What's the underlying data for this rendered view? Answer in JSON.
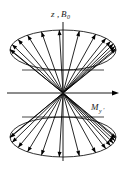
{
  "figure": {
    "caption": "",
    "background_color": "#ffffff",
    "ink_color": "#000000",
    "width": 128,
    "height": 171
  },
  "axes": {
    "vertical": {
      "name": "z-axis",
      "label_main": "z",
      "label_separator": ",",
      "label_second": "B",
      "label_second_subscript": "0",
      "label_full": "z, B0",
      "x": 63,
      "y_top": 22,
      "y_bottom": 161,
      "has_arrowhead": false
    },
    "horizontal": {
      "name": "transverse-axis",
      "label_main": "M",
      "label_subscript": "y",
      "label_prime": "'",
      "label_full": "My'",
      "y": 93,
      "x_left": 7,
      "x_right": 119,
      "has_arrowhead": true
    }
  },
  "origin": {
    "x": 63,
    "y": 93
  },
  "chart_data": {
    "type": "scatter",
    "xlabel": "My'",
    "ylabel": "z, B0",
    "cones": [
      {
        "name": "upper-cone",
        "apex": {
          "x": 63,
          "y": 93
        },
        "rim_center": {
          "x": 63,
          "y": 50
        },
        "rim_rx": 53,
        "rim_ry": 20,
        "back_rim_y": 70,
        "vector_count": 13
      },
      {
        "name": "lower-cone",
        "apex": {
          "x": 63,
          "y": 93
        },
        "rim_center": {
          "x": 63,
          "y": 137
        },
        "rim_rx": 53,
        "rim_ry": 20,
        "back_rim_y": 117,
        "vector_count": 13
      }
    ],
    "upper_vector_angles_deg": [
      182,
      196,
      212,
      228,
      246,
      266,
      288,
      308,
      324,
      334,
      342,
      349,
      356
    ],
    "lower_vector_angles_deg": [
      178,
      164,
      148,
      132,
      114,
      94,
      72,
      52,
      36,
      26,
      18,
      11,
      4
    ],
    "grid": false,
    "legend": null
  }
}
